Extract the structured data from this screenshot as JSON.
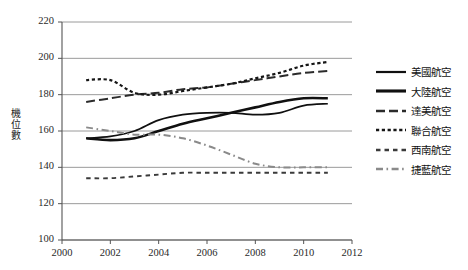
{
  "chart_data": {
    "type": "line",
    "title": "",
    "xlabel": "",
    "ylabel": "機位數",
    "xlim": [
      2000,
      2012
    ],
    "ylim": [
      100,
      220
    ],
    "xticks": [
      "2000",
      "2002",
      "2004",
      "2006",
      "2008",
      "2010",
      "2012"
    ],
    "yticks": [
      "100",
      "120",
      "140",
      "160",
      "180",
      "200",
      "220"
    ],
    "grid": true,
    "legend_position": "right",
    "x": [
      2001,
      2002,
      2003,
      2004,
      2005,
      2006,
      2007,
      2008,
      2009,
      2010,
      2011
    ],
    "series": [
      {
        "name": "美國航空",
        "style": "solid-thin",
        "color": "#101010",
        "values": [
          156,
          157,
          160,
          166,
          169,
          170,
          170,
          169,
          170,
          174,
          175
        ]
      },
      {
        "name": "大陸航空",
        "style": "solid-thick",
        "color": "#101010",
        "values": [
          156,
          155,
          156,
          160,
          164,
          167,
          170,
          173,
          176,
          178,
          178
        ]
      },
      {
        "name": "達美航空",
        "style": "long-dash",
        "color": "#2b2b2b",
        "values": [
          176,
          178,
          180,
          181,
          183,
          184,
          186,
          188,
          190,
          192,
          193
        ]
      },
      {
        "name": "聯合航空",
        "style": "dotted",
        "color": "#161616",
        "values": [
          188,
          188,
          181,
          180,
          182,
          184,
          186,
          189,
          192,
          196,
          198
        ]
      },
      {
        "name": "西南航空",
        "style": "dash-small",
        "color": "#3a3a3a",
        "values": [
          134,
          134,
          135,
          136,
          137,
          137,
          137,
          137,
          137,
          137,
          137
        ]
      },
      {
        "name": "捷藍航空",
        "style": "dash-dot-gray",
        "color": "#8a8a8a",
        "values": [
          162,
          160,
          158,
          158,
          156,
          152,
          147,
          142,
          140,
          140,
          140
        ]
      }
    ]
  },
  "legend": {
    "entries": [
      {
        "label": "美國航空"
      },
      {
        "label": "大陸航空"
      },
      {
        "label": "達美航空"
      },
      {
        "label": "聯合航空"
      },
      {
        "label": "西南航空"
      },
      {
        "label": "捷藍航空"
      }
    ]
  },
  "axes": {
    "y_axis_title": "機位數"
  }
}
